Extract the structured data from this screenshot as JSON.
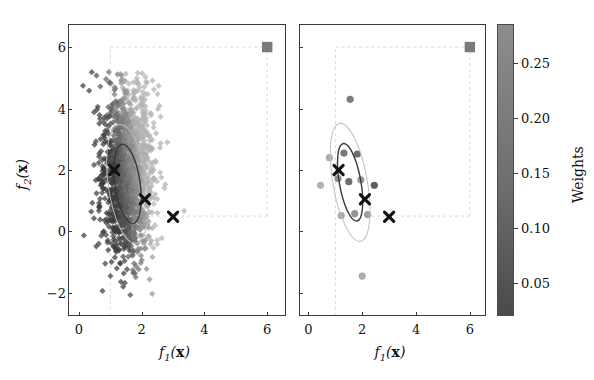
{
  "figure": {
    "width": 594,
    "height": 380,
    "background": "#ffffff"
  },
  "panels": [
    {
      "id": "left",
      "name": "population-scatter-panel",
      "xlabel": "f_1(x)",
      "ylabel": "f_2(x)",
      "xticks": [
        0,
        2,
        4,
        6
      ],
      "yticks": [
        -2,
        0,
        2,
        4,
        6
      ],
      "xlim": [
        -0.35,
        6.6
      ],
      "ylim": [
        -2.75,
        6.75
      ],
      "show_ylabel": true
    },
    {
      "id": "right",
      "name": "selected-solutions-panel",
      "xlabel": "f_1(x)",
      "ylabel": "f_2(x)",
      "xticks": [
        0,
        2,
        4,
        6
      ],
      "yticks": [
        -2,
        0,
        2,
        4,
        6
      ],
      "xlim": [
        -0.35,
        6.6
      ],
      "ylim": [
        -2.75,
        6.75
      ],
      "show_ylabel": false
    }
  ],
  "colorbar": {
    "title": "Weights",
    "ticks": [
      0.05,
      0.1,
      0.15,
      0.2,
      0.25
    ],
    "tick_labels": [
      "0.05",
      "0.10",
      "0.15",
      "0.20",
      "0.25"
    ],
    "vmin": 0.02,
    "vmax": 0.285,
    "color_low": "#4a4a4a",
    "color_high": "#8d8d8d"
  },
  "chart_data": {
    "type": "scatter",
    "title": "",
    "xlabel": "f_1(x)",
    "ylabel": "f_2(x)",
    "xlim": [
      -0.35,
      6.6
    ],
    "ylim": [
      -2.75,
      6.75
    ],
    "grid": false,
    "colormap": "gray",
    "colorbar_label": "Weights",
    "colorbar_range": [
      0.02,
      0.285
    ],
    "legend": "none",
    "panels": [
      {
        "name": "left",
        "description": "dense population cloud of diamond markers shaded by weight",
        "cloud": {
          "marker": "diamond",
          "n_points": 1400,
          "center_x": 1.55,
          "center_y": 1.9,
          "spread_x": 0.42,
          "spread_y": 1.35,
          "weight_min": 0.03,
          "weight_max": 0.27
        },
        "reference_point": {
          "x": 6.0,
          "y": 6.0,
          "marker": "square",
          "color": "#7a7a7a"
        },
        "dashed_lines": [
          {
            "type": "vertical",
            "x": 1.0,
            "y_from": -2.75,
            "y_to": 6.0
          },
          {
            "type": "horizontal",
            "y": 6.0,
            "x_from": 1.0,
            "x_to": 6.0
          },
          {
            "type": "vertical",
            "x": 6.0,
            "y_from": 0.5,
            "y_to": 6.0
          },
          {
            "type": "horizontal",
            "y": 0.5,
            "x_from": 2.1,
            "x_to": 6.0
          }
        ],
        "ellipses": [
          {
            "cx": 1.55,
            "cy": 1.55,
            "rx": 0.4,
            "ry": 1.3,
            "angle": -8,
            "stroke": "#3a3a3a",
            "style": "solid"
          },
          {
            "cx": 1.55,
            "cy": 1.55,
            "rx": 0.62,
            "ry": 1.95,
            "angle": -8,
            "stroke": "#b9b9b9",
            "style": "solid"
          }
        ],
        "x_markers": [
          {
            "x": 1.12,
            "y": 2.0
          },
          {
            "x": 2.1,
            "y": 1.05
          },
          {
            "x": 3.0,
            "y": 0.48
          }
        ]
      },
      {
        "name": "right",
        "description": "sparse selected solutions, circles shaded by weight",
        "points": [
          {
            "x": 1.55,
            "y": 4.3,
            "w": 0.16
          },
          {
            "x": 0.78,
            "y": 2.4,
            "w": 0.26
          },
          {
            "x": 1.32,
            "y": 2.55,
            "w": 0.15
          },
          {
            "x": 1.82,
            "y": 2.52,
            "w": 0.13
          },
          {
            "x": 1.1,
            "y": 1.72,
            "w": 0.2
          },
          {
            "x": 0.45,
            "y": 1.5,
            "w": 0.27
          },
          {
            "x": 1.5,
            "y": 1.62,
            "w": 0.13
          },
          {
            "x": 1.95,
            "y": 1.68,
            "w": 0.22
          },
          {
            "x": 2.45,
            "y": 1.5,
            "w": 0.1
          },
          {
            "x": 1.22,
            "y": 0.52,
            "w": 0.25
          },
          {
            "x": 1.72,
            "y": 0.58,
            "w": 0.21
          },
          {
            "x": 2.2,
            "y": 0.55,
            "w": 0.23
          },
          {
            "x": 2.0,
            "y": -1.45,
            "w": 0.26
          }
        ],
        "reference_point": {
          "x": 6.0,
          "y": 6.0,
          "marker": "square",
          "color": "#7a7a7a"
        },
        "dashed_lines": [
          {
            "type": "vertical",
            "x": 1.0,
            "y_from": -2.75,
            "y_to": 6.0
          },
          {
            "type": "horizontal",
            "y": 6.0,
            "x_from": 1.0,
            "x_to": 6.0
          },
          {
            "type": "vertical",
            "x": 6.0,
            "y_from": 0.5,
            "y_to": 6.0
          },
          {
            "type": "horizontal",
            "y": 0.5,
            "x_from": 2.1,
            "x_to": 6.0
          }
        ],
        "ellipses": [
          {
            "cx": 1.55,
            "cy": 1.6,
            "rx": 0.4,
            "ry": 1.28,
            "angle": -10,
            "stroke": "#3a3a3a",
            "style": "solid"
          },
          {
            "cx": 1.55,
            "cy": 1.6,
            "rx": 0.64,
            "ry": 1.95,
            "angle": -10,
            "stroke": "#c0c0c0",
            "style": "solid"
          }
        ],
        "x_markers": [
          {
            "x": 1.12,
            "y": 2.0
          },
          {
            "x": 2.1,
            "y": 1.05
          },
          {
            "x": 3.0,
            "y": 0.48
          }
        ]
      }
    ]
  }
}
